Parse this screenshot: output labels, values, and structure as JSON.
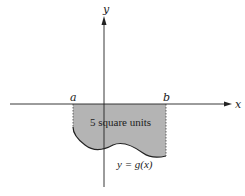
{
  "diagram": {
    "axes": {
      "x_label": "x",
      "y_label": "y"
    },
    "bounds": {
      "a_label": "a",
      "b_label": "b"
    },
    "region": {
      "label": "5 square units",
      "fill": "#b4b4b4"
    },
    "curve": {
      "label": "y = g(x)"
    }
  }
}
